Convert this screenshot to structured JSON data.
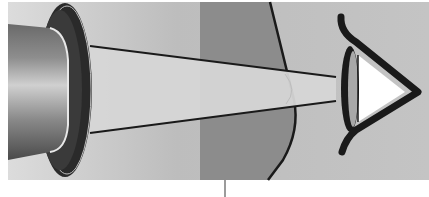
{
  "figure": {
    "type": "illustration",
    "components": [
      {
        "name": "light-source-lamp",
        "shape": "cylinder"
      },
      {
        "name": "lamp-flange",
        "shape": "dark ring"
      },
      {
        "name": "light-beam",
        "shape": "converging trapezoid"
      },
      {
        "name": "medium-region",
        "shape": "dark gray curved band"
      },
      {
        "name": "eye",
        "shape": "stylized side-view eye"
      },
      {
        "name": "label-pointer-line",
        "shape": "vertical tick"
      }
    ],
    "labels": []
  },
  "colors": {
    "panel_bg": "#c8c8c8",
    "medium": "#8c8c8c",
    "beam": "#d4d4d4",
    "outline": "#1a1a1a",
    "flange": "#2a2a2a",
    "eye_white": "#ffffff",
    "lens": "#a8a8a8"
  }
}
